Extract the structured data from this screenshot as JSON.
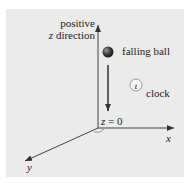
{
  "diagram": {
    "labels": {
      "z_axis_line1": "positive",
      "z_axis_line2_var": "z",
      "z_axis_line2_text": " direction",
      "ball": "falling ball",
      "clock_symbol": "t",
      "clock": "clock",
      "origin_var": "z",
      "origin_text": " = 0",
      "x_axis": "x",
      "y_axis": "y"
    },
    "colors": {
      "panel_background": "#ebebeb",
      "axis": "#333333",
      "ball": "#3a3a3a",
      "clock_fill": "#f2f2f2"
    }
  }
}
